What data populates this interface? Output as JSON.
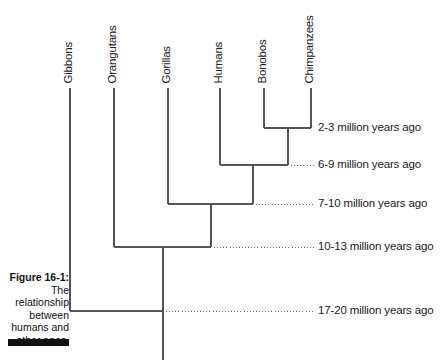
{
  "figure": {
    "caption_title": "Figure 16-1:",
    "caption_body": "The relationship between humans and other apes.",
    "stroke_color": "#555555",
    "text_color": "#1b1b1b",
    "rule_color": "#111111",
    "background": "#ffffff"
  },
  "taxa": [
    {
      "name": "Gibbons",
      "x": 70,
      "top_y": 88,
      "label_bottom_y": 83
    },
    {
      "name": "Orangutans",
      "x": 114,
      "top_y": 88,
      "label_bottom_y": 83
    },
    {
      "name": "Gorillas",
      "x": 168,
      "top_y": 88,
      "label_bottom_y": 83
    },
    {
      "name": "Humans",
      "x": 220,
      "top_y": 88,
      "label_bottom_y": 83
    },
    {
      "name": "Bonobos",
      "x": 264,
      "top_y": 88,
      "label_bottom_y": 83
    },
    {
      "name": "Chimpanzees",
      "x": 311,
      "top_y": 88,
      "label_bottom_y": 83
    }
  ],
  "nodes": [
    {
      "id": "pan",
      "label": "2-3 million years ago",
      "y": 128,
      "left_x": 264,
      "right_x": 311,
      "stem_x": 288,
      "leader": false
    },
    {
      "id": "hominini",
      "label": "6-9 million years ago",
      "y": 165,
      "left_x": 220,
      "right_x": 288,
      "stem_x": 253,
      "leader": true
    },
    {
      "id": "homininae",
      "label": "7-10 million years ago",
      "y": 204,
      "left_x": 168,
      "right_x": 253,
      "stem_x": 211,
      "leader": true
    },
    {
      "id": "hominidae",
      "label": "10-13 million years ago",
      "y": 247,
      "left_x": 114,
      "right_x": 211,
      "stem_x": 163,
      "leader": true
    },
    {
      "id": "hominoidea",
      "label": "17-20 million years ago",
      "y": 311,
      "left_x": 70,
      "right_x": 163,
      "stem_x": 163,
      "leader": true
    }
  ],
  "root": {
    "x": 163,
    "from_y": 311,
    "to_y": 360
  },
  "axis": {
    "units": "million years ago",
    "oldest": 20,
    "youngest": 2
  },
  "chart_data": {
    "type": "tree",
    "title": "The relationship between humans and other apes.",
    "xlabel": "",
    "ylabel": "million years ago",
    "leaves": [
      "Gibbons",
      "Orangutans",
      "Gorillas",
      "Humans",
      "Bonobos",
      "Chimpanzees"
    ],
    "divergences": [
      {
        "clade": [
          "Bonobos",
          "Chimpanzees"
        ],
        "age_range": [
          2,
          3
        ],
        "label": "2-3 million years ago"
      },
      {
        "clade": [
          "Humans",
          "Bonobos",
          "Chimpanzees"
        ],
        "age_range": [
          6,
          9
        ],
        "label": "6-9 million years ago"
      },
      {
        "clade": [
          "Gorillas",
          "Humans",
          "Bonobos",
          "Chimpanzees"
        ],
        "age_range": [
          7,
          10
        ],
        "label": "7-10 million years ago"
      },
      {
        "clade": [
          "Orangutans",
          "Gorillas",
          "Humans",
          "Bonobos",
          "Chimpanzees"
        ],
        "age_range": [
          10,
          13
        ],
        "label": "10-13 million years ago"
      },
      {
        "clade": [
          "Gibbons",
          "Orangutans",
          "Gorillas",
          "Humans",
          "Bonobos",
          "Chimpanzees"
        ],
        "age_range": [
          17,
          20
        ],
        "label": "17-20 million years ago"
      }
    ]
  }
}
